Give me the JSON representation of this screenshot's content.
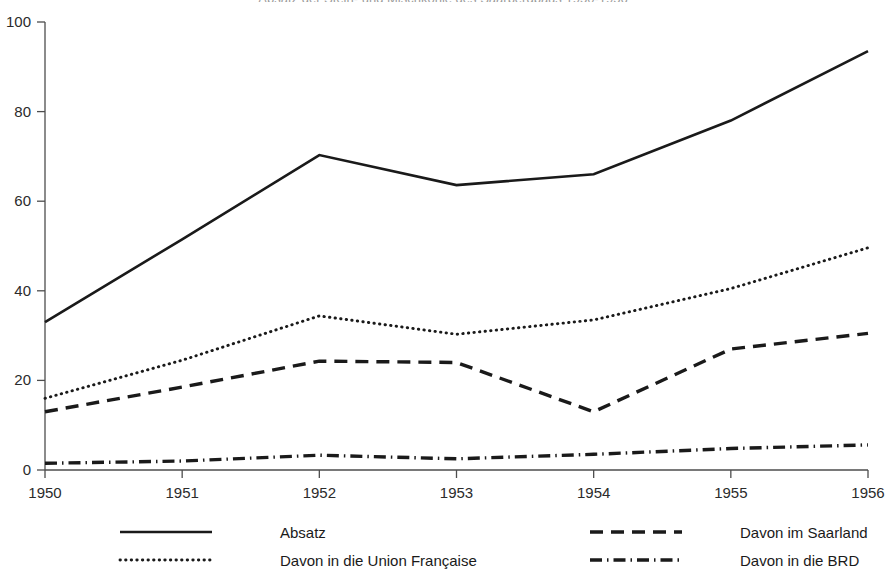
{
  "chart_data": {
    "type": "line",
    "title": "Absatz der Stein- und Mischkohle des Saarbergbaus 1950-1956",
    "xlabel": "",
    "ylabel": "",
    "x": [
      1950,
      1951,
      1952,
      1953,
      1954,
      1955,
      1956
    ],
    "categories": [
      "1950",
      "1951",
      "1952",
      "1953",
      "1954",
      "1955",
      "1956"
    ],
    "xlim": [
      1950,
      1956
    ],
    "ylim": [
      0,
      100
    ],
    "yticks": [
      0,
      20,
      40,
      60,
      80,
      100
    ],
    "ytick_labels": [
      "0",
      "20",
      "40",
      "60",
      "80",
      "100"
    ],
    "xticks": [
      1950,
      1951,
      1952,
      1953,
      1954,
      1955,
      1956
    ],
    "xtick_labels": [
      "1950",
      "1951",
      "1952",
      "1953",
      "1954",
      "1955",
      "1956"
    ],
    "grid": false,
    "legend_position": "bottom",
    "series": [
      {
        "name": "Absatz",
        "style": "solid",
        "color": "#1a1a1a",
        "values": [
          33.0,
          51.5,
          70.3,
          63.6,
          66.0,
          78.0,
          93.5
        ]
      },
      {
        "name": "Davon in die Union Française",
        "style": "dotted",
        "color": "#1a1a1a",
        "values": [
          16.0,
          24.5,
          34.4,
          30.3,
          33.5,
          40.5,
          49.6
        ]
      },
      {
        "name": "Davon im Saarland",
        "style": "dashed",
        "color": "#1a1a1a",
        "values": [
          13.0,
          18.5,
          24.3,
          24.0,
          13.0,
          27.0,
          30.5
        ]
      },
      {
        "name": "Davon in die BRD",
        "style": "dashdot",
        "color": "#1a1a1a",
        "values": [
          1.5,
          2.0,
          3.3,
          2.5,
          3.5,
          4.8,
          5.6
        ]
      }
    ]
  },
  "legend": {
    "entries": [
      {
        "label": "Absatz",
        "style": "solid"
      },
      {
        "label": "Davon im Saarland",
        "style": "dashed"
      },
      {
        "label": "Davon in die Union Française",
        "style": "dotted"
      },
      {
        "label": "Davon in die BRD",
        "style": "dashdot"
      }
    ]
  },
  "axes": {
    "y_labels": [
      "100",
      "80",
      "60",
      "40",
      "20",
      "0"
    ],
    "x_labels": [
      "1950",
      "1951",
      "1952",
      "1953",
      "1954",
      "1955",
      "1956"
    ]
  }
}
